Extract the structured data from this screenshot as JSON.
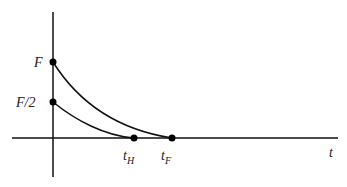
{
  "diagram": {
    "axes": {
      "x_label": "t"
    },
    "y_labels": {
      "full": "F",
      "half": "F/2"
    },
    "x_points": [
      {
        "base": "t",
        "sub": "H"
      },
      {
        "base": "t",
        "sub": "F"
      }
    ],
    "curves": [
      {
        "name": "full",
        "start": "F",
        "end": "t_F"
      },
      {
        "name": "half",
        "start": "F/2",
        "end": "t_H"
      }
    ]
  }
}
